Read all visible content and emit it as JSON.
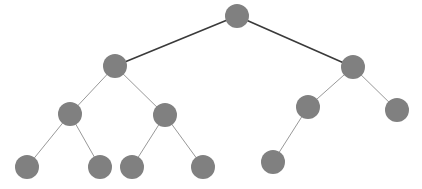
{
  "diagram": {
    "type": "binary-tree",
    "canvas": {
      "width": 422,
      "height": 189,
      "background": "#ffffff"
    },
    "style": {
      "node_fill": "#808080",
      "node_radius": 12,
      "edge_color_primary": "#3a3a3a",
      "edge_color_secondary": "#8c8c8c",
      "edge_width_primary": 1.6,
      "edge_width_secondary": 0.9
    },
    "nodes": [
      {
        "id": "root",
        "label": "",
        "cx": 237,
        "cy": 16,
        "r": 12,
        "depth": 0
      },
      {
        "id": "n-l",
        "label": "",
        "cx": 115,
        "cy": 66,
        "r": 12,
        "depth": 1
      },
      {
        "id": "n-r",
        "label": "",
        "cx": 353,
        "cy": 67,
        "r": 12,
        "depth": 1
      },
      {
        "id": "n-ll",
        "label": "",
        "cx": 70,
        "cy": 114,
        "r": 12,
        "depth": 2
      },
      {
        "id": "n-lr",
        "label": "",
        "cx": 165,
        "cy": 115,
        "r": 12,
        "depth": 2
      },
      {
        "id": "n-rl",
        "label": "",
        "cx": 308,
        "cy": 107,
        "r": 12,
        "depth": 2
      },
      {
        "id": "n-rr",
        "label": "",
        "cx": 397,
        "cy": 110,
        "r": 12,
        "depth": 2
      },
      {
        "id": "n-lll",
        "label": "",
        "cx": 27,
        "cy": 167,
        "r": 12,
        "depth": 3
      },
      {
        "id": "n-llr",
        "label": "",
        "cx": 100,
        "cy": 167,
        "r": 12,
        "depth": 3
      },
      {
        "id": "n-lrl",
        "label": "",
        "cx": 132,
        "cy": 167,
        "r": 12,
        "depth": 3
      },
      {
        "id": "n-lrr",
        "label": "",
        "cx": 203,
        "cy": 167,
        "r": 12,
        "depth": 3
      },
      {
        "id": "n-rll",
        "label": "",
        "cx": 273,
        "cy": 162,
        "r": 12,
        "depth": 3
      }
    ],
    "edges": [
      {
        "from": "root",
        "to": "n-l",
        "weight": "primary"
      },
      {
        "from": "root",
        "to": "n-r",
        "weight": "primary"
      },
      {
        "from": "n-l",
        "to": "n-ll",
        "weight": "secondary"
      },
      {
        "from": "n-l",
        "to": "n-lr",
        "weight": "secondary"
      },
      {
        "from": "n-r",
        "to": "n-rl",
        "weight": "secondary"
      },
      {
        "from": "n-r",
        "to": "n-rr",
        "weight": "secondary"
      },
      {
        "from": "n-ll",
        "to": "n-lll",
        "weight": "secondary"
      },
      {
        "from": "n-ll",
        "to": "n-llr",
        "weight": "secondary"
      },
      {
        "from": "n-lr",
        "to": "n-lrl",
        "weight": "secondary"
      },
      {
        "from": "n-lr",
        "to": "n-lrr",
        "weight": "secondary"
      },
      {
        "from": "n-rl",
        "to": "n-rll",
        "weight": "secondary"
      }
    ]
  }
}
